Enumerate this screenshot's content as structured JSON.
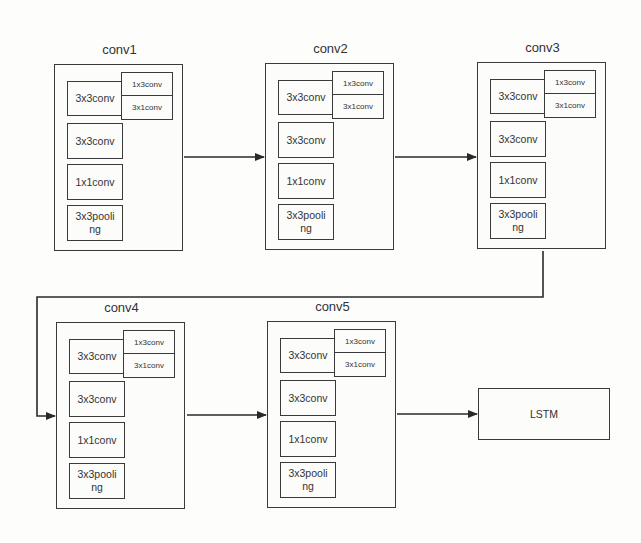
{
  "diagram": {
    "title": "",
    "blocks": [
      {
        "id": "conv1",
        "label": "conv1",
        "ops": {
          "main": "3x3conv",
          "branch_top": "1x3conv",
          "branch_bottom": "3x1conv",
          "op2": "3x3conv",
          "op3": "1x1conv",
          "op4_line1": "3x3pooli",
          "op4_line2": "ng"
        }
      },
      {
        "id": "conv2",
        "label": "conv2",
        "ops": {
          "main": "3x3conv",
          "branch_top": "1x3conv",
          "branch_bottom": "3x1conv",
          "op2": "3x3conv",
          "op3": "1x1conv",
          "op4_line1": "3x3pooli",
          "op4_line2": "ng"
        }
      },
      {
        "id": "conv3",
        "label": "conv3",
        "ops": {
          "main": "3x3conv",
          "branch_top": "1x3conv",
          "branch_bottom": "3x1conv",
          "op2": "3x3conv",
          "op3": "1x1conv",
          "op4_line1": "3x3pooli",
          "op4_line2": "ng"
        }
      },
      {
        "id": "conv4",
        "label": "conv4",
        "ops": {
          "main": "3x3conv",
          "branch_top": "1x3conv",
          "branch_bottom": "3x1conv",
          "op2": "3x3conv",
          "op3": "1x1conv",
          "op4_line1": "3x3pooli",
          "op4_line2": "ng"
        }
      },
      {
        "id": "conv5",
        "label": "conv5",
        "ops": {
          "main": "3x3conv",
          "branch_top": "1x3conv",
          "branch_bottom": "3x1conv",
          "op2": "3x3conv",
          "op3": "1x1conv",
          "op4_line1": "3x3pooli",
          "op4_line2": "ng"
        }
      }
    ],
    "output": {
      "label": "LSTM"
    },
    "edges": [
      {
        "from": "conv1",
        "to": "conv2"
      },
      {
        "from": "conv2",
        "to": "conv3"
      },
      {
        "from": "conv3",
        "to": "conv4"
      },
      {
        "from": "conv4",
        "to": "conv5"
      },
      {
        "from": "conv5",
        "to": "LSTM"
      }
    ],
    "colors": {
      "line": "#2a2a2a",
      "background": "#fdfdfc"
    }
  }
}
